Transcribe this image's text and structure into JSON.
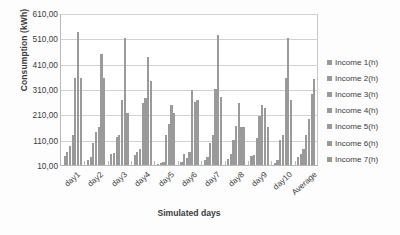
{
  "chart_data": {
    "type": "bar",
    "title": "",
    "xlabel": "Simulated days",
    "ylabel": "Consumption (kWh)",
    "ylim": [
      10,
      610
    ],
    "ytick_values": [
      10,
      110,
      210,
      310,
      410,
      510,
      610
    ],
    "ytick_labels": [
      "10,00",
      "110,00",
      "210,00",
      "310,00",
      "410,00",
      "510,00",
      "610,00"
    ],
    "grid": true,
    "legend_position": "right",
    "bar_color": "#9a9a9a",
    "categories": [
      "day1",
      "day2",
      "day3",
      "day4",
      "day5",
      "day6",
      "day7",
      "day8",
      "day9",
      "day10",
      "Average"
    ],
    "series": [
      {
        "name": "Income 1(h)",
        "values": [
          45,
          28,
          52,
          48,
          14,
          22,
          30,
          35,
          45,
          18,
          40
        ]
      },
      {
        "name": "Income 2(h)",
        "values": [
          60,
          40,
          58,
          60,
          18,
          55,
          40,
          52,
          50,
          28,
          55
        ]
      },
      {
        "name": "Income 3(h)",
        "values": [
          85,
          95,
          120,
          75,
          20,
          38,
          95,
          110,
          115,
          110,
          75
        ]
      },
      {
        "name": "Income 4(h)",
        "values": [
          130,
          140,
          130,
          255,
          130,
          60,
          130,
          165,
          205,
          130,
          130
        ]
      },
      {
        "name": "Income 5(h)",
        "values": [
          355,
          160,
          265,
          275,
          170,
          305,
          310,
          255,
          245,
          355,
          190
        ]
      },
      {
        "name": "Income 6(h)",
        "values": [
          535,
          450,
          512,
          437,
          248,
          260,
          525,
          160,
          235,
          512,
          290
        ]
      },
      {
        "name": "Income 7(h)",
        "values": [
          355,
          355,
          215,
          340,
          215,
          265,
          280,
          160,
          160,
          265,
          350
        ]
      }
    ]
  },
  "legend": {
    "items": [
      {
        "label": "Income 1(h)"
      },
      {
        "label": "Income 2(h)"
      },
      {
        "label": "Income 3(h)"
      },
      {
        "label": "Income 4(h)"
      },
      {
        "label": "Income 5(h)"
      },
      {
        "label": "Income 6(h)"
      },
      {
        "label": "Income 7(h)"
      }
    ]
  }
}
